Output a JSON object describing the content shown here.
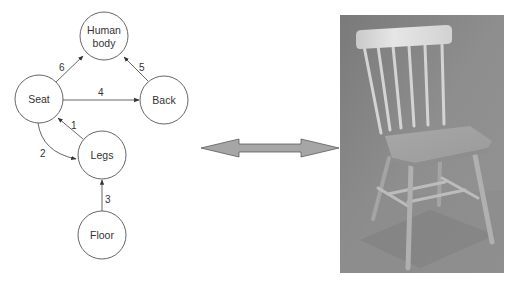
{
  "diagram": {
    "stroke_color": "#555555",
    "node_fill": "#ffffff",
    "nodes": [
      {
        "id": "human-body",
        "lines": [
          "Human",
          "body"
        ],
        "cx": 104,
        "cy": 36,
        "r": 24
      },
      {
        "id": "seat",
        "lines": [
          "Seat"
        ],
        "cx": 39,
        "cy": 99,
        "r": 24
      },
      {
        "id": "back",
        "lines": [
          "Back"
        ],
        "cx": 164,
        "cy": 100,
        "r": 24
      },
      {
        "id": "legs",
        "lines": [
          "Legs"
        ],
        "cx": 102,
        "cy": 155,
        "r": 24
      },
      {
        "id": "floor",
        "lines": [
          "Floor"
        ],
        "cx": 102,
        "cy": 235,
        "r": 24
      }
    ],
    "edges": [
      {
        "label": "1",
        "from": "legs",
        "to": "seat"
      },
      {
        "label": "2",
        "from": "seat",
        "to": "legs",
        "curved": true
      },
      {
        "label": "3",
        "from": "floor",
        "to": "legs"
      },
      {
        "label": "4",
        "from": "seat",
        "to": "back"
      },
      {
        "label": "5",
        "from": "back",
        "to": "human-body"
      },
      {
        "label": "6",
        "from": "seat",
        "to": "human-body"
      }
    ]
  },
  "connector": {
    "type": "double-headed-arrow",
    "fill": "#a6a6a6",
    "stroke": "#5a5a5a"
  },
  "photo": {
    "subject": "wooden spindle-back chair",
    "style": "grayscale photograph",
    "background": "#8a8a8a"
  }
}
